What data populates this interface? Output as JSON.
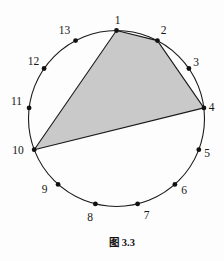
{
  "figure": {
    "caption": "图 3.3",
    "colors": {
      "background": "#fdfdfd",
      "line": "#1a1a1a",
      "dot": "#111111",
      "shade_fill": "#c9c9c9"
    },
    "circle": {
      "cx": 116.5,
      "cy": 118.5,
      "r": 88
    },
    "points": [
      {
        "id": 1,
        "label": "1",
        "x": 116.5,
        "y": 30.5,
        "label_x": 117.5,
        "label_y": 20
      },
      {
        "id": 2,
        "label": "2",
        "x": 157.4,
        "y": 40.6,
        "label_x": 163.5,
        "label_y": 29.5
      },
      {
        "id": 3,
        "label": "3",
        "x": 188.9,
        "y": 68.5,
        "label_x": 196,
        "label_y": 61.5
      },
      {
        "id": 4,
        "label": "4",
        "x": 203.9,
        "y": 107.9,
        "label_x": 211.5,
        "label_y": 107
      },
      {
        "id": 5,
        "label": "5",
        "x": 198.8,
        "y": 149.7,
        "label_x": 207,
        "label_y": 153
      },
      {
        "id": 6,
        "label": "6",
        "x": 174.9,
        "y": 184.4,
        "label_x": 184,
        "label_y": 190
      },
      {
        "id": 7,
        "label": "7",
        "x": 137.6,
        "y": 203.9,
        "label_x": 146.5,
        "label_y": 214.5
      },
      {
        "id": 8,
        "label": "8",
        "x": 95.4,
        "y": 203.9,
        "label_x": 90,
        "label_y": 217
      },
      {
        "id": 9,
        "label": "9",
        "x": 58.1,
        "y": 184.4,
        "label_x": 44.5,
        "label_y": 188.5
      },
      {
        "id": 10,
        "label": "10",
        "x": 34.2,
        "y": 149.7,
        "label_x": 18,
        "label_y": 149.5
      },
      {
        "id": 11,
        "label": "11",
        "x": 29.1,
        "y": 107.9,
        "label_x": 16.5,
        "label_y": 100.5
      },
      {
        "id": 12,
        "label": "12",
        "x": 44.1,
        "y": 68.5,
        "label_x": 33.5,
        "label_y": 61
      },
      {
        "id": 13,
        "label": "13",
        "x": 75.6,
        "y": 40.6,
        "label_x": 64.5,
        "label_y": 30
      }
    ],
    "shaded_polygon": {
      "vertex_ids": [
        1,
        2,
        4,
        10
      ]
    }
  }
}
